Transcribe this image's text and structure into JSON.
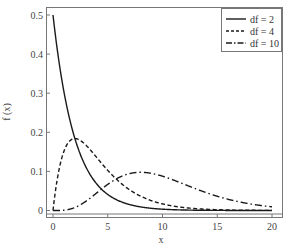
{
  "chart_data": {
    "type": "line",
    "title": "",
    "xlabel": "x",
    "ylabel": "f (x)",
    "xlim": [
      -0.6,
      21
    ],
    "ylim": [
      -0.01,
      0.52
    ],
    "x_ticks": [
      0,
      5,
      10,
      15,
      20
    ],
    "x_tick_labels": [
      "0",
      "5",
      "10",
      "15",
      "20"
    ],
    "y_ticks": [
      0,
      0.1,
      0.2,
      0.3,
      0.4,
      0.5
    ],
    "y_tick_labels": [
      "0",
      "0.1",
      "0.2",
      "0.3",
      "0.4",
      "0.5"
    ],
    "grid": false,
    "legend_position": "upper right",
    "series": [
      {
        "name": "df = 2",
        "df": 2,
        "style": "solid",
        "x": [
          0,
          1,
          2,
          3,
          4,
          5,
          6,
          8,
          10,
          12,
          15,
          20
        ],
        "values": [
          0.5,
          0.303,
          0.184,
          0.112,
          0.068,
          0.041,
          0.025,
          0.009,
          0.003,
          0.001,
          0.0003,
          0.0
        ]
      },
      {
        "name": "df = 4",
        "df": 4,
        "style": "dashed",
        "x": [
          0,
          1,
          2,
          3,
          4,
          5,
          6,
          8,
          10,
          12,
          15,
          20
        ],
        "values": [
          0.0,
          0.152,
          0.184,
          0.167,
          0.135,
          0.103,
          0.075,
          0.037,
          0.017,
          0.007,
          0.002,
          0.0002
        ]
      },
      {
        "name": "df = 10",
        "df": 10,
        "style": "dash-dot",
        "x": [
          0,
          1,
          2,
          3,
          4,
          5,
          6,
          8,
          10,
          12,
          15,
          20
        ],
        "values": [
          0.0,
          0.0008,
          0.0076,
          0.0235,
          0.0451,
          0.0668,
          0.084,
          0.0977,
          0.0877,
          0.0669,
          0.0366,
          0.0095
        ]
      }
    ]
  },
  "legend": {
    "items": [
      {
        "label": "df = 2",
        "style": "solid"
      },
      {
        "label": "df = 4",
        "style": "dashed"
      },
      {
        "label": "df = 10",
        "style": "dash-dot"
      }
    ]
  },
  "colors": {
    "line": "#1a1a1a",
    "axis": "#666666",
    "text": "#444444"
  }
}
